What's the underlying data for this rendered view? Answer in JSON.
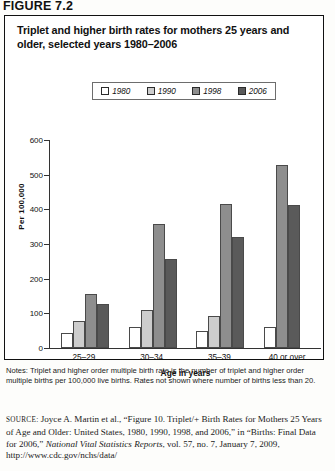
{
  "figure": {
    "label": "FIGURE 7.2",
    "title": "Triplet and higher birth rates for mothers 25 years and older, selected years 1980–2006"
  },
  "legend": {
    "items": [
      {
        "label": "1980",
        "color": "#ffffff",
        "name": "legend-swatch-1980"
      },
      {
        "label": "1990",
        "color": "#cdcdcd",
        "name": "legend-swatch-1990"
      },
      {
        "label": "1998",
        "color": "#8e8e8e",
        "name": "legend-swatch-1998"
      },
      {
        "label": "2006",
        "color": "#5a5a5a",
        "name": "legend-swatch-2006"
      }
    ]
  },
  "notes": {
    "text": "Notes: Triplet and higher order multiple birth rate is the number of triplet and higher order multiple births per 100,000 live births. Rates not shown where number of births less than 20."
  },
  "source": {
    "prefix": "SOURCE:",
    "body_1": " Joyce A. Martin et al., “Figure 10. Triplet/+ Birth Rates for Mothers 25 Years of Age and Older: United States, 1980, 1990, 1998, and 2006,” in “Births: Final Data for 2006,” ",
    "italic_1": "National Vital Statistics Reports",
    "body_2": ", vol. 57, no. 7, January 7, 2009, http://www.cdc.gov/nchs/data/"
  },
  "chart_data": {
    "type": "bar",
    "title": "Triplet and higher birth rates for mothers 25 years and older, selected years 1980–2006",
    "xlabel": "Age in years",
    "ylabel": "Per 100,000",
    "categories": [
      "25–29",
      "30–34",
      "35–39",
      "40 or over"
    ],
    "ylim": [
      0,
      600
    ],
    "yticks": [
      0,
      100,
      200,
      300,
      400,
      500,
      600
    ],
    "grid": false,
    "legend_position": "top-center",
    "series": [
      {
        "name": "1980",
        "color": "#ffffff",
        "values": [
          43,
          62,
          49,
          61
        ]
      },
      {
        "name": "1990",
        "color": "#cdcdcd",
        "values": [
          78,
          110,
          92,
          0
        ]
      },
      {
        "name": "1998",
        "color": "#8e8e8e",
        "values": [
          156,
          357,
          415,
          529
        ]
      },
      {
        "name": "2006",
        "color": "#5a5a5a",
        "values": [
          127,
          256,
          319,
          412
        ]
      }
    ]
  }
}
